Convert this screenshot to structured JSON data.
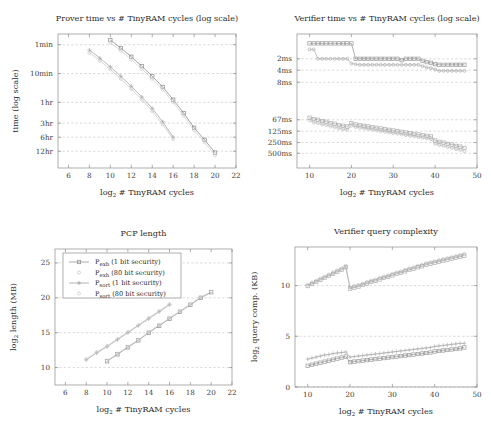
{
  "figure": {
    "background": "#ffffff",
    "axis_color": "#8c8c8c",
    "grid_color": "#b9b9b9"
  },
  "legend": {
    "position": "top-left-of-pcp-length-panel",
    "items": [
      {
        "label": "P",
        "sub": "exh",
        "suffix": " (1 bit security)",
        "marker": "square",
        "color": "#8f8f8f",
        "full": "P_exh (1 bit security)"
      },
      {
        "label": "P",
        "sub": "exh",
        "suffix": " (80 bit security)",
        "marker": "dot",
        "color": "#c4c4c4",
        "full": "P_exh (80 bit security)"
      },
      {
        "label": "P",
        "sub": "sort",
        "suffix": " (1 bit security)",
        "marker": "plus",
        "color": "#9a9a9a",
        "full": "P_sort (1 bit security)"
      },
      {
        "label": "P",
        "sub": "sort",
        "suffix": " (80 bit security)",
        "marker": "dot",
        "color": "#c9c9c9",
        "full": "P_sort (80 bit security)"
      }
    ]
  },
  "chart_data": [
    {
      "id": "prover-time",
      "type": "line",
      "title": "Prover time vs # TinyRAM cycles (log scale)",
      "xlabel": "log₂ # TinyRAM cycles",
      "ylabel": "time (log scale)",
      "xlim": [
        5,
        22
      ],
      "ylim": [
        0,
        100
      ],
      "xticks": [
        6,
        8,
        10,
        12,
        14,
        16,
        18,
        20,
        22
      ],
      "yticks": [
        12.5,
        23.0,
        33.5,
        49.0,
        70.5,
        92.0
      ],
      "yticklabels": [
        "12hr",
        "6hr",
        "3hr",
        "1hr",
        "10min",
        "1min"
      ],
      "grid": true,
      "series": [
        {
          "name": "P_sort (1 bit security)",
          "color": "#a3a3a3",
          "marker": "plus",
          "x": [
            8,
            9,
            10,
            11,
            12,
            13,
            14,
            15,
            16
          ],
          "y": [
            88.0,
            82.0,
            75.5,
            68.5,
            61.0,
            53.0,
            44.5,
            34.5,
            23.0
          ]
        },
        {
          "name": "P_sort (80 bit security)",
          "color": "#c8c8c8",
          "marker": "dot",
          "x": [
            8,
            9,
            10,
            11,
            12,
            13,
            14,
            15,
            16
          ],
          "y": [
            86.0,
            80.0,
            73.5,
            66.5,
            59.0,
            51.0,
            42.5,
            32.5,
            21.5
          ]
        },
        {
          "name": "P_exh (1 bit security)",
          "color": "#8a8a8a",
          "marker": "square",
          "x": [
            10,
            11,
            12,
            13,
            14,
            15,
            16,
            17,
            18,
            19,
            20
          ],
          "y": [
            95.5,
            89.5,
            83.0,
            76.0,
            68.5,
            60.5,
            51.0,
            41.0,
            30.0,
            21.0,
            11.5
          ]
        },
        {
          "name": "P_exh (80 bit security)",
          "color": "#cfcfcf",
          "marker": "dot",
          "x": [
            10,
            11,
            12,
            13,
            14,
            15,
            16,
            17,
            18,
            19,
            20
          ],
          "y": [
            93.5,
            87.5,
            81.0,
            74.0,
            66.5,
            58.5,
            49.0,
            39.0,
            28.0,
            19.0,
            9.5
          ]
        }
      ]
    },
    {
      "id": "verifier-time",
      "type": "line",
      "title": "Verifier time vs # TinyRAM cycles (log scale)",
      "xlabel": "log₂ # TinyRAM cycles",
      "ylabel": "",
      "xlim": [
        7,
        50
      ],
      "ylim": [
        0,
        100
      ],
      "xticks": [
        10,
        20,
        30,
        40,
        50
      ],
      "yticks": [
        11.0,
        19.0,
        27.5,
        36.0,
        64.0,
        73.0,
        81.5
      ],
      "yticklabels": [
        "500ms",
        "250ms",
        "125ms",
        "67ms",
        "8ms",
        "4ms",
        "2ms"
      ],
      "grid": true,
      "series": [
        {
          "name": "P_sort (80 bit security)",
          "color": "#c2c2c2",
          "marker": "dot",
          "x": [
            10,
            11,
            12,
            13,
            14,
            15,
            16,
            17,
            18,
            19,
            20,
            21,
            22,
            23,
            24,
            25,
            26,
            27,
            28,
            29,
            30,
            31,
            32,
            33,
            34,
            35,
            36,
            37,
            38,
            39,
            40,
            41,
            42,
            43,
            44,
            45,
            46,
            47
          ],
          "y": [
            35.5,
            34.0,
            33.5,
            32.5,
            32.0,
            31.0,
            30.5,
            29.5,
            29.0,
            28.5,
            31.5,
            30.5,
            30.0,
            29.5,
            29.0,
            28.5,
            28.0,
            27.5,
            27.0,
            26.5,
            26.0,
            25.5,
            25.0,
            24.5,
            24.0,
            23.5,
            23.0,
            22.5,
            22.0,
            21.5,
            18.0,
            17.0,
            16.5,
            15.5,
            15.0,
            14.0,
            13.5,
            12.5
          ]
        },
        {
          "name": "P_exh (80 bit security)",
          "color": "#adadad",
          "marker": "square",
          "x": [
            10,
            11,
            12,
            13,
            14,
            15,
            16,
            17,
            18,
            19,
            20,
            21,
            22,
            23,
            24,
            25,
            26,
            27,
            28,
            29,
            30,
            31,
            32,
            33,
            34,
            35,
            36,
            37,
            38,
            39,
            40,
            41,
            42,
            43,
            44,
            45,
            46,
            47
          ],
          "y": [
            37.5,
            36.5,
            36.0,
            35.0,
            34.5,
            33.5,
            33.0,
            32.0,
            31.5,
            31.0,
            33.5,
            32.5,
            32.0,
            31.5,
            31.0,
            30.5,
            30.0,
            29.5,
            29.0,
            28.5,
            28.0,
            27.5,
            27.0,
            26.5,
            26.0,
            25.5,
            25.0,
            24.5,
            24.0,
            23.5,
            20.5,
            19.5,
            19.0,
            18.0,
            17.5,
            16.5,
            16.0,
            15.0
          ]
        },
        {
          "name": "P_sort (1 bit security)",
          "color": "#b0b0b0",
          "marker": "dot",
          "x": [
            10,
            11,
            12,
            13,
            14,
            15,
            16,
            17,
            18,
            19,
            20,
            21,
            22,
            23,
            24,
            25,
            26,
            27,
            28,
            29,
            30,
            31,
            32,
            33,
            34,
            35,
            36,
            37,
            38,
            39,
            40,
            41,
            42,
            43,
            44,
            45,
            46,
            47
          ],
          "y": [
            88.5,
            88.5,
            81.5,
            81.5,
            81.5,
            81.5,
            81.5,
            81.5,
            81.5,
            81.5,
            78.0,
            77.5,
            77.0,
            77.0,
            77.0,
            77.0,
            77.0,
            77.0,
            77.0,
            77.0,
            77.0,
            77.0,
            77.0,
            77.0,
            77.0,
            77.0,
            77.0,
            76.0,
            75.0,
            74.5,
            73.5,
            72.5,
            72.5,
            72.5,
            72.5,
            72.5,
            72.5,
            72.5
          ]
        },
        {
          "name": "P_exh (1 bit security)",
          "color": "#999999",
          "marker": "square",
          "x": [
            10,
            11,
            12,
            13,
            14,
            15,
            16,
            17,
            18,
            19,
            20,
            21,
            22,
            23,
            24,
            25,
            26,
            27,
            28,
            29,
            30,
            31,
            32,
            33,
            34,
            35,
            36,
            37,
            38,
            39,
            40,
            41,
            42,
            43,
            44,
            45,
            46,
            47
          ],
          "y": [
            93.0,
            93.0,
            93.0,
            93.0,
            93.0,
            93.0,
            93.0,
            93.0,
            93.0,
            93.0,
            93.0,
            81.5,
            81.5,
            81.5,
            81.5,
            81.5,
            81.5,
            81.5,
            81.5,
            81.5,
            81.5,
            81.5,
            80.5,
            81.5,
            81.5,
            81.5,
            81.5,
            80.0,
            79.0,
            78.5,
            77.5,
            77.0,
            77.0,
            77.0,
            77.0,
            77.0,
            77.0,
            77.0
          ]
        }
      ]
    },
    {
      "id": "pcp-length",
      "type": "line",
      "title": "PCP length",
      "xlabel": "log₂ # TinyRAM cycles",
      "ylabel": "log₂ length (MB)",
      "xlim": [
        5,
        22
      ],
      "ylim": [
        7.5,
        27
      ],
      "xticks": [
        6,
        8,
        10,
        12,
        14,
        16,
        18,
        20,
        22
      ],
      "yticks": [
        10,
        15,
        20,
        25
      ],
      "grid": true,
      "series": [
        {
          "name": "P_sort (1 bit security)",
          "color": "#a3a3a3",
          "marker": "plus",
          "x": [
            8,
            9,
            10,
            11,
            12,
            13,
            14,
            15,
            16
          ],
          "y": [
            11.1,
            12.1,
            13.0,
            14.0,
            15.0,
            16.0,
            17.0,
            18.0,
            19.0
          ]
        },
        {
          "name": "P_sort (80 bit security)",
          "color": "#c8c8c8",
          "marker": "dot",
          "x": [
            8,
            9,
            10,
            11,
            12,
            13,
            14,
            15,
            16
          ],
          "y": [
            11.2,
            12.2,
            13.1,
            14.1,
            15.1,
            16.1,
            17.1,
            18.1,
            19.1
          ]
        },
        {
          "name": "P_exh (1 bit security)",
          "color": "#8a8a8a",
          "marker": "square",
          "x": [
            10,
            11,
            12,
            13,
            14,
            15,
            16,
            17,
            18,
            19,
            20
          ],
          "y": [
            10.9,
            11.9,
            12.9,
            13.9,
            15.0,
            16.0,
            17.0,
            18.0,
            19.0,
            20.0,
            20.8
          ]
        },
        {
          "name": "P_exh (80 bit security)",
          "color": "#cfcfcf",
          "marker": "dot",
          "x": [
            10,
            11,
            12,
            13,
            14,
            15,
            16,
            17,
            18,
            19,
            20
          ],
          "y": [
            11.0,
            12.0,
            13.0,
            14.0,
            15.1,
            16.1,
            17.1,
            18.1,
            19.1,
            20.1,
            20.9
          ]
        }
      ]
    },
    {
      "id": "verifier-query-complexity",
      "type": "line",
      "title": "Verifier query complexity",
      "xlabel": "log₂ # TinyRAM cycles",
      "ylabel": "log₂ query comp. (KB)",
      "xlim": [
        7,
        50
      ],
      "ylim": [
        0,
        13.8
      ],
      "xticks": [
        10,
        20,
        30,
        40,
        50
      ],
      "yticks": [
        0,
        5,
        10
      ],
      "grid": true,
      "series": [
        {
          "name": "P_sort (80 bit security)",
          "color": "#c2c2c2",
          "marker": "dot",
          "x": [
            10,
            11,
            12,
            13,
            14,
            15,
            16,
            17,
            18,
            19,
            20,
            21,
            22,
            23,
            24,
            25,
            26,
            27,
            28,
            29,
            30,
            31,
            32,
            33,
            34,
            35,
            36,
            37,
            38,
            39,
            40,
            41,
            42,
            43,
            44,
            45,
            46,
            47
          ],
          "y": [
            10.1,
            10.3,
            10.5,
            10.7,
            10.9,
            11.1,
            11.3,
            11.5,
            11.7,
            11.95,
            9.85,
            9.95,
            10.05,
            10.2,
            10.35,
            10.5,
            10.6,
            10.75,
            10.9,
            11.0,
            11.15,
            11.3,
            11.4,
            11.55,
            11.7,
            11.8,
            11.95,
            12.05,
            12.2,
            12.3,
            12.4,
            12.5,
            12.6,
            12.7,
            12.8,
            12.9,
            13.0,
            13.1
          ]
        },
        {
          "name": "P_exh (80 bit security)",
          "color": "#adadad",
          "marker": "square",
          "x": [
            10,
            11,
            12,
            13,
            14,
            15,
            16,
            17,
            18,
            19,
            20,
            21,
            22,
            23,
            24,
            25,
            26,
            27,
            28,
            29,
            30,
            31,
            32,
            33,
            34,
            35,
            36,
            37,
            38,
            39,
            40,
            41,
            42,
            43,
            44,
            45,
            46,
            47
          ],
          "y": [
            9.95,
            10.15,
            10.35,
            10.55,
            10.75,
            10.95,
            11.15,
            11.35,
            11.55,
            11.8,
            9.7,
            9.8,
            9.9,
            10.05,
            10.2,
            10.35,
            10.45,
            10.6,
            10.75,
            10.85,
            11.0,
            11.15,
            11.25,
            11.4,
            11.55,
            11.65,
            11.8,
            11.9,
            12.05,
            12.15,
            12.25,
            12.35,
            12.45,
            12.55,
            12.65,
            12.75,
            12.85,
            12.95
          ]
        },
        {
          "name": "P_sort (1 bit security)",
          "color": "#b0b0b0",
          "marker": "plus",
          "x": [
            10,
            11,
            12,
            13,
            14,
            15,
            16,
            17,
            18,
            19,
            20,
            21,
            22,
            23,
            24,
            25,
            26,
            27,
            28,
            29,
            30,
            31,
            32,
            33,
            34,
            35,
            36,
            37,
            38,
            39,
            40,
            41,
            42,
            43,
            44,
            45,
            46,
            47
          ],
          "y": [
            2.75,
            2.85,
            2.95,
            3.05,
            3.15,
            3.2,
            3.3,
            3.35,
            3.4,
            3.45,
            2.95,
            3.0,
            3.05,
            3.1,
            3.15,
            3.2,
            3.25,
            3.3,
            3.35,
            3.4,
            3.45,
            3.5,
            3.55,
            3.6,
            3.65,
            3.7,
            3.75,
            3.8,
            3.85,
            3.9,
            4.0,
            4.05,
            4.1,
            4.15,
            4.2,
            4.25,
            4.3,
            4.3
          ]
        },
        {
          "name": "P_exh (1 bit security)",
          "color": "#999999",
          "marker": "square",
          "x": [
            10,
            11,
            12,
            13,
            14,
            15,
            16,
            17,
            18,
            19,
            20,
            21,
            22,
            23,
            24,
            25,
            26,
            27,
            28,
            29,
            30,
            31,
            32,
            33,
            34,
            35,
            36,
            37,
            38,
            39,
            40,
            41,
            42,
            43,
            44,
            45,
            46,
            47
          ],
          "y": [
            2.1,
            2.2,
            2.3,
            2.4,
            2.5,
            2.6,
            2.7,
            2.8,
            2.9,
            3.0,
            2.45,
            2.5,
            2.55,
            2.6,
            2.65,
            2.7,
            2.75,
            2.8,
            2.85,
            2.9,
            2.95,
            3.0,
            3.05,
            3.1,
            3.15,
            3.2,
            3.25,
            3.3,
            3.35,
            3.4,
            3.5,
            3.55,
            3.6,
            3.65,
            3.7,
            3.75,
            3.8,
            3.9
          ]
        }
      ]
    }
  ]
}
